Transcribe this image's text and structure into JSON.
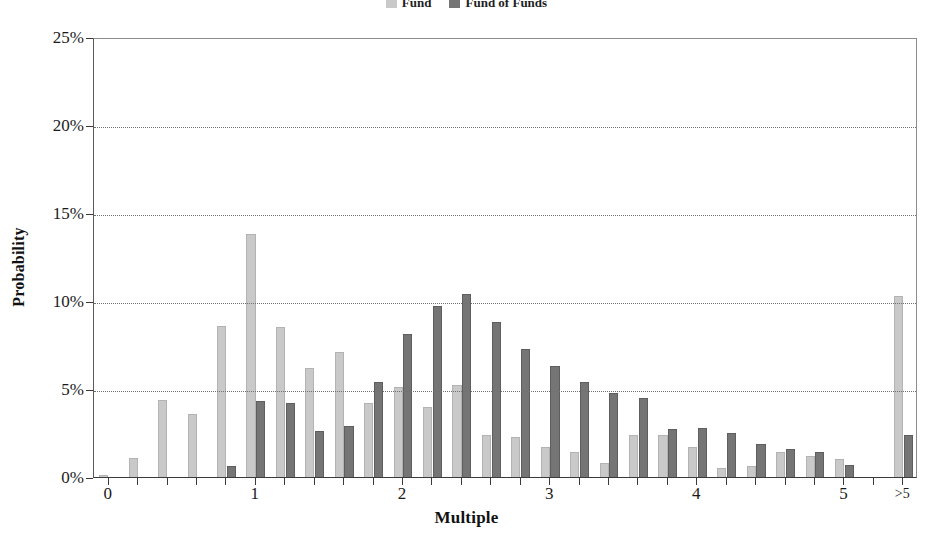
{
  "chart_data": {
    "type": "bar",
    "title": "",
    "xlabel": "Multiple",
    "ylabel": "Probability",
    "xlim": [
      -0.1,
      5.5
    ],
    "ylim": [
      0,
      25
    ],
    "grid": true,
    "legend_position": "top-center",
    "y_tick_labels": [
      "0%",
      "5%",
      "10%",
      "15%",
      "20%",
      "25%"
    ],
    "y_tick_values": [
      0,
      5,
      10,
      15,
      20,
      25
    ],
    "x_tick_labels": [
      "0",
      "1",
      "2",
      "3",
      "4",
      "5",
      ">5"
    ],
    "x_tick_values": [
      0,
      1,
      2,
      3,
      4,
      5,
      5.4
    ],
    "categories": [
      0.0,
      0.2,
      0.4,
      0.6,
      0.8,
      1.0,
      1.2,
      1.4,
      1.6,
      1.8,
      2.0,
      2.2,
      2.4,
      2.6,
      2.8,
      3.0,
      3.2,
      3.4,
      3.6,
      3.8,
      4.0,
      4.2,
      4.4,
      4.6,
      4.8,
      5.0,
      5.4
    ],
    "series": [
      {
        "name": "Fund",
        "color": "#c9c9c9",
        "values": [
          0.1,
          1.1,
          4.4,
          3.6,
          8.6,
          13.8,
          8.5,
          6.2,
          7.1,
          4.2,
          5.1,
          4.0,
          5.2,
          2.4,
          2.3,
          1.7,
          1.4,
          0.8,
          2.4,
          2.4,
          1.7,
          0.5,
          0.6,
          1.4,
          1.2,
          1.0,
          10.3
        ]
      },
      {
        "name": "Fund of Funds",
        "color": "#757575",
        "values": [
          0.0,
          0.0,
          0.0,
          0.0,
          0.6,
          4.3,
          4.2,
          2.6,
          2.9,
          5.4,
          8.1,
          9.7,
          10.4,
          8.8,
          7.3,
          6.3,
          5.4,
          4.8,
          4.5,
          2.7,
          2.8,
          2.5,
          1.9,
          1.6,
          1.4,
          0.7,
          2.4
        ]
      }
    ]
  },
  "legend": {
    "items": [
      {
        "label": "Fund",
        "color": "#c9c9c9"
      },
      {
        "label": "Fund of Funds",
        "color": "#757575"
      }
    ]
  },
  "axes": {
    "x_title": "Multiple",
    "y_title": "Probability"
  }
}
